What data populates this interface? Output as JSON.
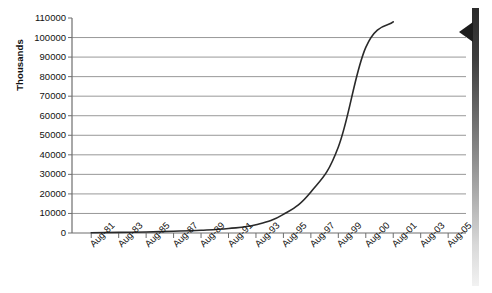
{
  "chart_data": {
    "type": "line",
    "title": "",
    "xlabel": "",
    "ylabel": "Thousands",
    "ylim": [
      0,
      110000
    ],
    "ytick_values": [
      110000,
      100000,
      90000,
      80000,
      70000,
      60000,
      50000,
      40000,
      30000,
      20000,
      10000,
      0
    ],
    "ytick_labels": [
      "110000",
      "100000",
      "90000",
      "80000",
      "70000",
      "60000",
      "50000",
      "40000",
      "30000",
      "20000",
      "10000",
      "0"
    ],
    "grid": true,
    "gridlines_at": [
      100000,
      90000,
      80000,
      70000,
      60000,
      50000,
      40000,
      30000,
      20000,
      10000
    ],
    "legend": "none",
    "categories": [
      "Aug-81",
      "Aug-83",
      "Aug-85",
      "Aug-87",
      "Aug-89",
      "Aug-91",
      "Aug-93",
      "Aug-95",
      "Aug-97",
      "Aug-99",
      "Aug-00",
      "Aug-01",
      "Aug-03",
      "Aug-05"
    ],
    "series": [
      {
        "name": "series-1",
        "values": [
          150,
          300,
          550,
          900,
          1400,
          2300,
          4200,
          9500,
          21000,
          44000,
          95000,
          108000,
          null,
          null
        ]
      }
    ],
    "line_color": "#2a2a2a",
    "grid_color": "#8c8c8c",
    "axis_color": "#6e6e6e"
  },
  "markers": {
    "right_strip_name": "scrollbar-strip",
    "right_marker_name": "left-arrow-marker"
  }
}
